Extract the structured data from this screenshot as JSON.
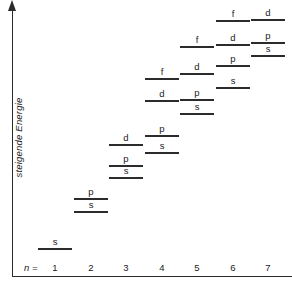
{
  "figure": {
    "title": "",
    "y_axis_label": "steigende Energie",
    "n_label": "n =",
    "axis_color": "#2b2b2b"
  },
  "chart_data": {
    "type": "scatter",
    "title": "",
    "xlabel": "n =",
    "ylabel": "steigende Energie",
    "grid": false,
    "legend": "none",
    "x_tick_labels": [
      "1",
      "2",
      "3",
      "4",
      "5",
      "6",
      "7"
    ],
    "x_tick_x_px": [
      55,
      91,
      126,
      162,
      197,
      233,
      268
    ],
    "xlim": [
      0.5,
      7.5
    ],
    "ylim": [
      0,
      1
    ],
    "annotations": [
      "steigende Energie"
    ],
    "note": "Energy level (orbital) diagram: horizontal bars mark relative orbital energies for shells n=1..7 with subshell labels s, p, d, f",
    "levels": [
      {
        "n": 1,
        "subshell": "s",
        "x_center": 55,
        "y_px": 248
      },
      {
        "n": 2,
        "subshell": "p",
        "x_center": 91,
        "y_px": 198
      },
      {
        "n": 2,
        "subshell": "s",
        "x_center": 91,
        "y_px": 211
      },
      {
        "n": 3,
        "subshell": "d",
        "x_center": 126,
        "y_px": 144
      },
      {
        "n": 3,
        "subshell": "p",
        "x_center": 126,
        "y_px": 165
      },
      {
        "n": 3,
        "subshell": "s",
        "x_center": 126,
        "y_px": 177
      },
      {
        "n": 4,
        "subshell": "f",
        "x_center": 162,
        "y_px": 78
      },
      {
        "n": 4,
        "subshell": "d",
        "x_center": 162,
        "y_px": 100
      },
      {
        "n": 4,
        "subshell": "p",
        "x_center": 162,
        "y_px": 135
      },
      {
        "n": 4,
        "subshell": "s",
        "x_center": 162,
        "y_px": 152
      },
      {
        "n": 5,
        "subshell": "f",
        "x_center": 197,
        "y_px": 46
      },
      {
        "n": 5,
        "subshell": "d",
        "x_center": 197,
        "y_px": 73
      },
      {
        "n": 5,
        "subshell": "p",
        "x_center": 197,
        "y_px": 99
      },
      {
        "n": 5,
        "subshell": "s",
        "x_center": 197,
        "y_px": 113
      },
      {
        "n": 6,
        "subshell": "f",
        "x_center": 233,
        "y_px": 20
      },
      {
        "n": 6,
        "subshell": "d",
        "x_center": 233,
        "y_px": 44
      },
      {
        "n": 6,
        "subshell": "p",
        "x_center": 233,
        "y_px": 65
      },
      {
        "n": 6,
        "subshell": "s",
        "x_center": 233,
        "y_px": 87
      },
      {
        "n": 7,
        "subshell": "d",
        "x_center": 268,
        "y_px": 19
      },
      {
        "n": 7,
        "subshell": "p",
        "x_center": 268,
        "y_px": 42
      },
      {
        "n": 7,
        "subshell": "s",
        "x_center": 268,
        "y_px": 55
      }
    ]
  }
}
